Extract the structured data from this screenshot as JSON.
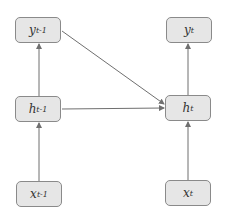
{
  "diagram": {
    "type": "recurrent-neural-network-unrolled",
    "nodes": [
      {
        "id": "y_prev",
        "base": "y",
        "sub": "t-1",
        "x": 15,
        "y": 17
      },
      {
        "id": "y_t",
        "base": "y",
        "sub": "t",
        "x": 166,
        "y": 17
      },
      {
        "id": "h_prev",
        "base": "h",
        "sub": "t-1",
        "x": 15,
        "y": 96
      },
      {
        "id": "h_t",
        "base": "h",
        "sub": "t",
        "x": 165,
        "y": 95
      },
      {
        "id": "x_prev",
        "base": "x",
        "sub": "t-1",
        "x": 16,
        "y": 181
      },
      {
        "id": "x_t",
        "base": "x",
        "sub": "t",
        "x": 165,
        "y": 180
      }
    ],
    "edges": [
      {
        "from": "x_prev",
        "to": "h_prev"
      },
      {
        "from": "h_prev",
        "to": "y_prev"
      },
      {
        "from": "h_prev",
        "to": "h_t"
      },
      {
        "from": "y_prev",
        "to": "h_t"
      },
      {
        "from": "x_t",
        "to": "h_t"
      },
      {
        "from": "h_t",
        "to": "y_t"
      }
    ],
    "colors": {
      "node_fill": "#e6e6e6",
      "node_border": "#8a8a8a",
      "edge": "#6f6f6f"
    }
  }
}
